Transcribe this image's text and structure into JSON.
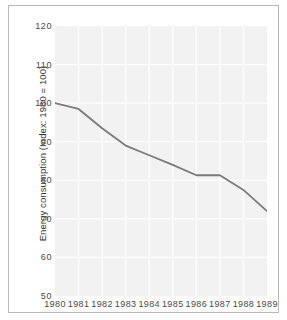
{
  "chart_data": {
    "type": "line",
    "title": "",
    "xlabel": "",
    "ylabel": "Energy consumption (Index: 1980 = 100)",
    "categories": [
      "1980",
      "1981",
      "1982",
      "1983",
      "1984",
      "1985",
      "1986",
      "1987",
      "1988",
      "1989"
    ],
    "x": [
      1980,
      1981,
      1982,
      1983,
      1984,
      1985,
      1986,
      1987,
      1988,
      1989
    ],
    "values": [
      100,
      98.5,
      93.5,
      89,
      86.5,
      84,
      81.3,
      81.3,
      77.5,
      72
    ],
    "series": [
      {
        "name": "Energy consumption index",
        "values": [
          100,
          98.5,
          93.5,
          89,
          86.5,
          84,
          81.3,
          81.3,
          77.5,
          72
        ],
        "color": "#7a7a7a"
      }
    ],
    "ylim": [
      50,
      120
    ],
    "xlim": [
      1980,
      1989
    ],
    "yticks": [
      50,
      60,
      70,
      80,
      90,
      100,
      110,
      120
    ],
    "ytick_labels": [
      "50",
      "60",
      "70",
      "80",
      "90",
      "100",
      "110",
      "120"
    ],
    "xticks": [
      1980,
      1981,
      1982,
      1983,
      1984,
      1985,
      1986,
      1987,
      1988,
      1989
    ],
    "xtick_labels": [
      "1980",
      "1981",
      "1982",
      "1983",
      "1984",
      "1985",
      "1986",
      "1987",
      "1988",
      "1989"
    ],
    "grid": true,
    "grid_color": "#ffffff",
    "plot_background": "#f2f2f2",
    "figure_background": "#ffffff",
    "frame_color": "#b8b8b8",
    "legend": null,
    "legend_position": "none",
    "annotations": []
  }
}
